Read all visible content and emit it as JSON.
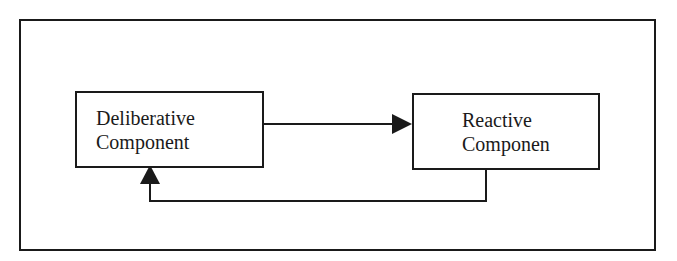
{
  "diagram": {
    "nodes": [
      {
        "id": "deliberative",
        "lines": [
          "Deliberative",
          "Component"
        ]
      },
      {
        "id": "reactive",
        "lines": [
          "Reactive",
          "Componen"
        ]
      }
    ],
    "edges": [
      {
        "from": "deliberative",
        "to": "reactive",
        "style": "solid-arrow"
      },
      {
        "from": "reactive",
        "to": "deliberative",
        "style": "solid-arrow",
        "route": "below"
      }
    ],
    "colors": {
      "stroke": "#1a1a1a",
      "background": "#ffffff"
    }
  }
}
